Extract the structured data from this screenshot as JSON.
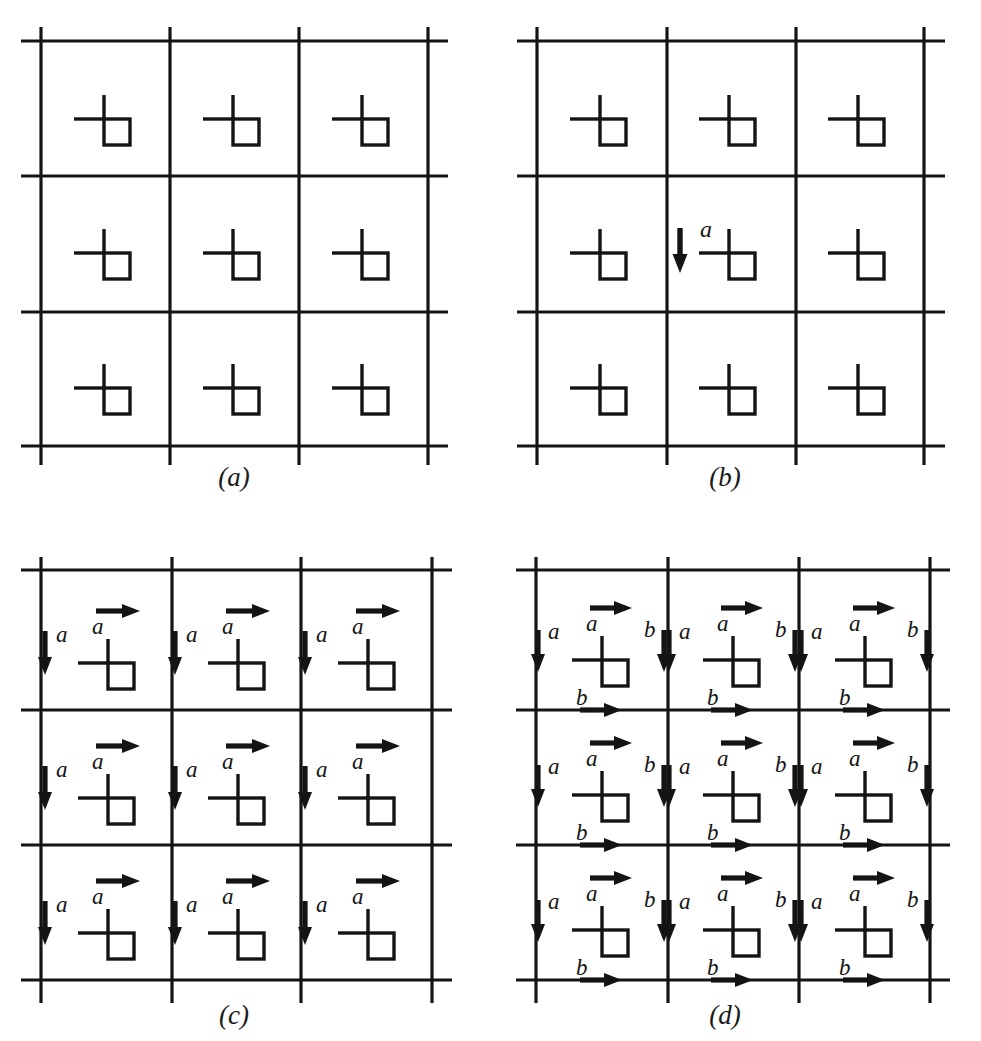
{
  "figure": {
    "type": "lattice-motif-diagram",
    "background_color": "#ffffff",
    "ink_color": "#141414",
    "panel_count": 4,
    "grid": {
      "rows": 3,
      "cols": 3,
      "cell_count": 9
    }
  },
  "panels": [
    {
      "id": "a",
      "caption": "(a)",
      "motif_count": 9,
      "arrows": [],
      "description": "3 by 3 array of lattice cells each containing one motif; no translation vectors shown"
    },
    {
      "id": "b",
      "caption": "(b)",
      "motif_count": 9,
      "arrows": [
        {
          "label": "a",
          "direction": "down",
          "cell": "center"
        }
      ],
      "description": "same lattice with a single downward translation vector a drawn beside the central motif"
    },
    {
      "id": "c",
      "caption": "(c)",
      "motif_count": 9,
      "arrows": [
        {
          "label": "a",
          "direction": "right",
          "position": "top"
        },
        {
          "label": "a",
          "direction": "down",
          "position": "left"
        }
      ],
      "description": "every motif carries a right-pointing vector a above it and a downward vector a to its left"
    },
    {
      "id": "d",
      "caption": "(d)",
      "motif_count": 9,
      "arrows": [
        {
          "label": "a",
          "direction": "right",
          "position": "top"
        },
        {
          "label": "a",
          "direction": "down",
          "position": "left"
        },
        {
          "label": "b",
          "direction": "down",
          "position": "right"
        },
        {
          "label": "b",
          "direction": "right",
          "position": "bottom"
        }
      ],
      "description": "every motif carries vectors a (right, top) and a (down, left) plus b (down, right) and b (right, bottom)"
    }
  ],
  "labels": {
    "vector_a": "a",
    "vector_b": "b"
  },
  "captions": {
    "a": "(a)",
    "b": "(b)",
    "c": "(c)",
    "d": "(d)"
  }
}
